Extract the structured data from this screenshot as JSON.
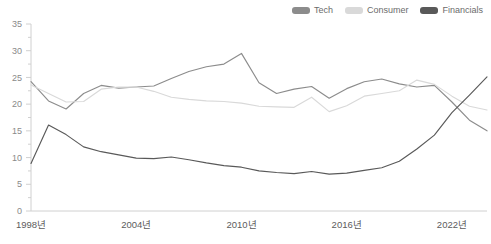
{
  "legend": {
    "position": "top-right",
    "items": [
      {
        "label": "Tech",
        "color": "#8c8c8c",
        "icon": "legend-swatch-icon"
      },
      {
        "label": "Consumer",
        "color": "#d9d9d9",
        "icon": "legend-swatch-icon"
      },
      {
        "label": "Financials",
        "color": "#595959",
        "icon": "legend-swatch-icon"
      }
    ]
  },
  "axes": {
    "y": {
      "ticks": [
        "0",
        "5",
        "10",
        "15",
        "20",
        "25",
        "30",
        "35"
      ],
      "min": 0,
      "max": 35,
      "step": 5,
      "minor_step": 2.5
    },
    "x": {
      "ticks": [
        "1998년",
        "2004년",
        "2010년",
        "2016년",
        "2022년"
      ],
      "tick_years": [
        1998,
        2004,
        2010,
        2016,
        2022
      ],
      "min": 1998,
      "max": 2024
    }
  },
  "chart_data": {
    "type": "line",
    "title": "",
    "subtitle": "",
    "xlabel": "",
    "ylabel": "",
    "xlim": [
      1998,
      2024
    ],
    "ylim": [
      0,
      35
    ],
    "grid": false,
    "legend_position": "top-right",
    "x": [
      1998,
      1999,
      2000,
      2001,
      2002,
      2003,
      2004,
      2005,
      2006,
      2007,
      2008,
      2009,
      2010,
      2011,
      2012,
      2013,
      2014,
      2015,
      2016,
      2017,
      2018,
      2019,
      2020,
      2021,
      2022,
      2023,
      2024
    ],
    "series": [
      {
        "name": "Tech",
        "color": "#8c8c8c",
        "values": [
          24.2,
          20.6,
          19.1,
          22.0,
          23.5,
          23.0,
          23.2,
          23.4,
          24.8,
          26.1,
          27.0,
          27.5,
          29.5,
          24.0,
          22.0,
          22.8,
          23.3,
          21.1,
          22.9,
          24.2,
          24.7,
          23.8,
          23.2,
          23.5,
          20.4,
          17.0,
          15.0
        ]
      },
      {
        "name": "Consumer",
        "color": "#d9d9d9",
        "values": [
          23.6,
          22.0,
          20.4,
          20.5,
          22.8,
          23.2,
          23.2,
          22.4,
          21.3,
          20.9,
          20.6,
          20.5,
          20.2,
          19.6,
          19.5,
          19.4,
          21.3,
          18.6,
          19.7,
          21.5,
          22.0,
          22.5,
          24.5,
          23.7,
          21.5,
          19.6,
          18.9
        ]
      },
      {
        "name": "Financials",
        "color": "#595959",
        "values": [
          8.9,
          16.1,
          14.3,
          12.0,
          11.1,
          10.5,
          9.9,
          9.8,
          10.1,
          9.6,
          9.0,
          8.5,
          8.2,
          7.5,
          7.2,
          7.0,
          7.4,
          6.9,
          7.1,
          7.6,
          8.1,
          9.3,
          11.6,
          14.2,
          18.4,
          21.7,
          25.1
        ]
      }
    ]
  },
  "source_note": ""
}
